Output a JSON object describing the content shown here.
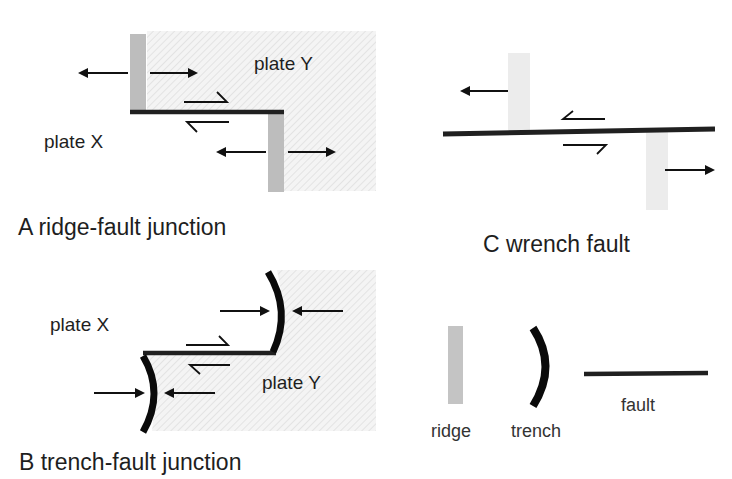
{
  "colors": {
    "hatch_bg": "#f4f4f4",
    "hatch_line": "#dcdcdc",
    "ridge_dark": "#bdbdbd",
    "ridge_light": "#ececec",
    "fault": "#202020",
    "trench": "#0a0a0a",
    "text": "#1e1e1e"
  },
  "panel_a": {
    "caption": "A ridge-fault junction",
    "plate_x": "plate X",
    "plate_y": "plate Y"
  },
  "panel_b": {
    "caption": "B trench-fault junction",
    "plate_x": "plate X",
    "plate_y": "plate Y"
  },
  "panel_c": {
    "caption": "C wrench fault"
  },
  "legend": {
    "ridge": "ridge",
    "trench": "trench",
    "fault": "fault"
  }
}
